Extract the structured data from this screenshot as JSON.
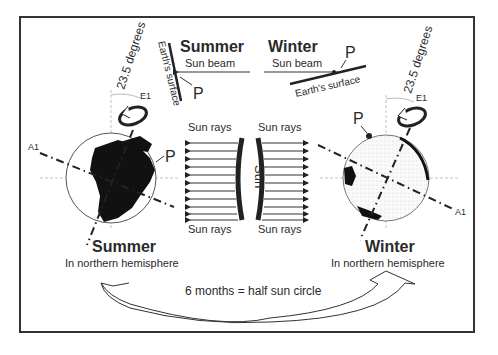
{
  "diagram": {
    "top_summer": {
      "title": "Summer",
      "beam_label": "Sun beam",
      "surface_label": "Earth's surface",
      "point_label": "P"
    },
    "top_winter": {
      "title": "Winter",
      "beam_label": "Sun beam",
      "surface_label": "Earth's surface",
      "point_label": "P"
    },
    "left_globe": {
      "tilt_label": "23.5 degrees",
      "rotation_label": "E1",
      "axis_label": "A1",
      "point_label": "P",
      "season": "Summer",
      "season_sub": "In northern hemisphere"
    },
    "right_globe": {
      "tilt_label": "23.5 degrees",
      "rotation_label": "E1",
      "axis_label": "A1",
      "point_label": "P",
      "season": "Winter",
      "season_sub": "In northern hemisphere"
    },
    "sun": {
      "label": "Sun",
      "rays_left_top": "Sun rays",
      "rays_left_bottom": "Sun rays",
      "rays_right_top": "Sun rays",
      "rays_right_bottom": "Sun rays",
      "ray_count": 11
    },
    "cycle_label": "6 months = half sun circle",
    "colors": {
      "ink": "#222222",
      "frame": "#333333",
      "guide": "#aaaaaa",
      "background": "#ffffff"
    }
  }
}
